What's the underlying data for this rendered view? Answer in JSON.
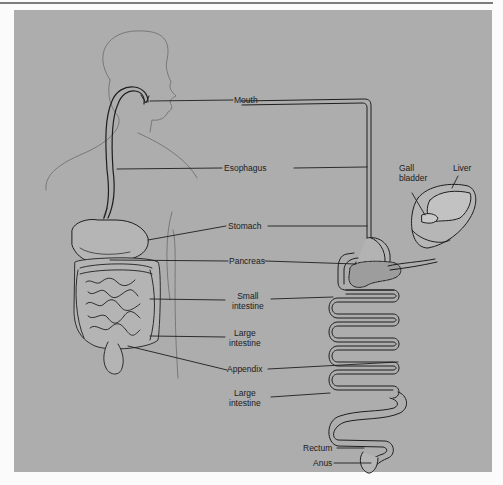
{
  "figure": {
    "panel_color": "#adadad",
    "line_color": "#2a2a2a",
    "labels": {
      "mouth": "Mouth",
      "esophagus": "Esophagus",
      "stomach": "Stomach",
      "pancreas": "Pancreas",
      "small_intestine_1": "Small",
      "small_intestine_2": "intestine",
      "large_intestine_upper_1": "Large",
      "large_intestine_upper_2": "intestine",
      "appendix": "Appendix",
      "large_intestine_lower_1": "Large",
      "large_intestine_lower_2": "intestine",
      "rectum": "Rectum",
      "anus": "Anus",
      "gall_bladder_1": "Gall",
      "gall_bladder_2": "bladder",
      "liver": "Liver"
    }
  }
}
